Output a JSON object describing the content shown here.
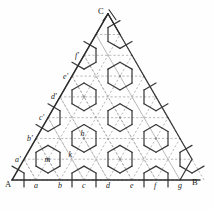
{
  "figure": {
    "colors": {
      "background": "#fefefe",
      "solid_line": "#3a3a3a",
      "dashed_line": "#9a9a9a",
      "outline": "#2b2b2b",
      "label": "#1b1b1b"
    },
    "geometry": {
      "origin_x": 12,
      "origin_y": 180,
      "cell_width": 24,
      "rows": 8,
      "columns": 8
    }
  },
  "vertices": {
    "A": "A",
    "B": "B",
    "C": "C"
  },
  "baseline_labels": [
    {
      "text": "a",
      "x": 36
    },
    {
      "text": "b",
      "x": 60
    },
    {
      "text": "c",
      "x": 84
    },
    {
      "text": "d",
      "x": 108
    },
    {
      "text": "e",
      "x": 132
    },
    {
      "text": "f",
      "x": 156
    },
    {
      "text": "g",
      "x": 180
    }
  ],
  "left_edge_labels": [
    {
      "text": "a′",
      "row": 1
    },
    {
      "text": "b′",
      "row": 2
    },
    {
      "text": "c′",
      "row": 3
    },
    {
      "text": "d′",
      "row": 4
    },
    {
      "text": "e′",
      "row": 5
    },
    {
      "text": "f′",
      "row": 6
    }
  ],
  "interior_labels": [
    {
      "text": "h"
    },
    {
      "text": "k"
    },
    {
      "text": "m"
    }
  ]
}
